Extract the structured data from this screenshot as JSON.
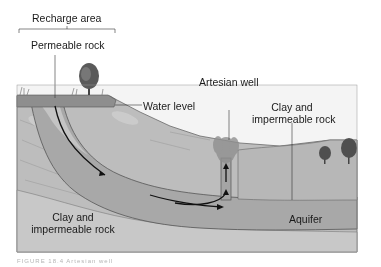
{
  "diagram": {
    "labels": {
      "recharge_area": "Recharge area",
      "permeable_rock": "Permeable rock",
      "water_level": "Water level",
      "artesian_well": "Artesian well",
      "clay_right_line1": "Clay and",
      "clay_right_line2": "impermeable rock",
      "clay_left_line1": "Clay and",
      "clay_left_line2": "impermeable rock",
      "aquifer": "Aquifer"
    },
    "caption": "FIGURE 18.4 Artesian well"
  },
  "colors": {
    "background": "#ffffff",
    "sky": "#f2f2f2",
    "clay_rock": "#b9b9b9",
    "clay_rock_light": "#cfcfcf",
    "aquifer": "#a9a9a9",
    "permeable_layer": "#c4c4c4",
    "topsoil": "#9a9a9a",
    "outline": "#5a5a5a",
    "arrow": "#111111",
    "tree": "#4a4a4a",
    "text": "#1a1a1a"
  }
}
